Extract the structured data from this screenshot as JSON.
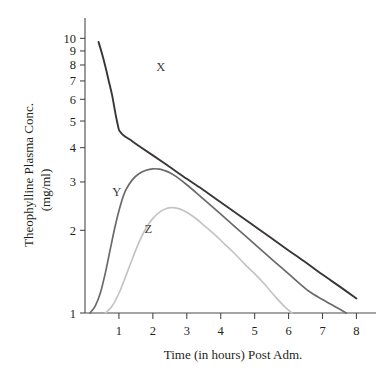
{
  "chart_data": {
    "type": "line",
    "title": "",
    "xlabel": "Time (in hours) Post Adm.",
    "ylabel_line1": "Theophylline Plasma Conc.",
    "ylabel_line2": "(mg/ml)",
    "xlim": [
      0,
      8.4
    ],
    "ylim": [
      1,
      11
    ],
    "yscale": "log",
    "xscale": "linear",
    "grid": false,
    "legend": "inline-curve-labels",
    "xticks": [
      1,
      2,
      3,
      4,
      5,
      6,
      7,
      8
    ],
    "xticklabels": [
      "1",
      "2",
      "3",
      "4",
      "5",
      "6",
      "7",
      "8"
    ],
    "yticks": [
      1,
      2,
      3,
      4,
      5,
      6,
      7,
      8,
      9,
      10
    ],
    "yticklabels": [
      "1",
      "2",
      "3",
      "4",
      "5",
      "6",
      "7",
      "8",
      "9",
      "10"
    ],
    "series": [
      {
        "name": "X",
        "label": "X",
        "color": "#3a3634",
        "width": 1.9,
        "label_x": 2.1,
        "label_y": 7.6,
        "x": [
          0.4,
          0.5,
          0.6,
          0.7,
          0.8,
          0.9,
          0.95,
          1.0,
          1.05,
          1.15,
          1.3,
          1.6,
          2.0,
          2.5,
          3.0,
          3.5,
          4.0,
          4.5,
          5.0,
          5.5,
          6.0,
          6.5,
          7.0,
          7.5,
          8.0
        ],
        "y": [
          9.7,
          8.8,
          7.9,
          7.0,
          6.2,
          5.3,
          4.95,
          4.65,
          4.55,
          4.42,
          4.3,
          4.05,
          3.75,
          3.4,
          3.08,
          2.8,
          2.53,
          2.29,
          2.07,
          1.87,
          1.69,
          1.53,
          1.38,
          1.25,
          1.13
        ]
      },
      {
        "name": "Y",
        "label": "Y",
        "color": "#6a6a6a",
        "width": 1.7,
        "label_x": 0.8,
        "label_y": 2.66,
        "x": [
          0.15,
          0.3,
          0.45,
          0.6,
          0.75,
          0.9,
          1.05,
          1.2,
          1.4,
          1.6,
          1.8,
          2.0,
          2.2,
          2.35,
          2.5,
          2.7,
          3.0,
          3.4,
          3.8,
          4.2,
          4.6,
          5.0,
          5.4,
          5.8,
          6.2,
          6.6,
          7.0,
          7.4,
          7.7
        ],
        "y": [
          1.0,
          1.06,
          1.18,
          1.4,
          1.72,
          2.1,
          2.48,
          2.8,
          3.06,
          3.22,
          3.31,
          3.35,
          3.34,
          3.3,
          3.24,
          3.13,
          2.93,
          2.66,
          2.41,
          2.18,
          1.97,
          1.78,
          1.61,
          1.46,
          1.32,
          1.2,
          1.12,
          1.05,
          1.0
        ]
      },
      {
        "name": "Z",
        "label": "Z",
        "color": "#c4c4c4",
        "width": 1.7,
        "label_x": 1.75,
        "label_y": 1.95,
        "x": [
          0.6,
          0.8,
          1.0,
          1.2,
          1.4,
          1.6,
          1.8,
          2.0,
          2.2,
          2.4,
          2.55,
          2.7,
          2.9,
          3.2,
          3.5,
          3.8,
          4.1,
          4.4,
          4.7,
          5.0,
          5.3,
          5.6,
          5.9,
          6.1
        ],
        "y": [
          1.0,
          1.06,
          1.18,
          1.36,
          1.58,
          1.82,
          2.04,
          2.21,
          2.33,
          2.4,
          2.42,
          2.41,
          2.36,
          2.24,
          2.09,
          1.94,
          1.79,
          1.65,
          1.51,
          1.39,
          1.27,
          1.15,
          1.05,
          1.0
        ]
      }
    ]
  }
}
